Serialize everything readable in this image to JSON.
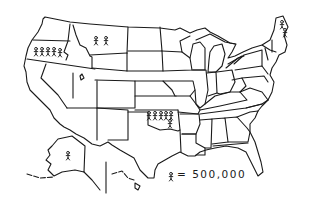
{
  "map": {
    "type": "pictogram-map",
    "region": "United States",
    "style": "hand-drawn line map with stick figures",
    "ink_color": "#1a1a1a",
    "background": "#ffffff"
  },
  "legend": {
    "symbol": "stick-figure",
    "equals": "= 500,000",
    "value": 500000
  },
  "markers": [
    {
      "state": "Oregon",
      "count": 5
    },
    {
      "state": "Montana",
      "count": 2
    },
    {
      "state": "Oklahoma",
      "count": 6
    },
    {
      "state": "Maine",
      "count": 2
    },
    {
      "state": "Alaska",
      "count": 1
    }
  ]
}
